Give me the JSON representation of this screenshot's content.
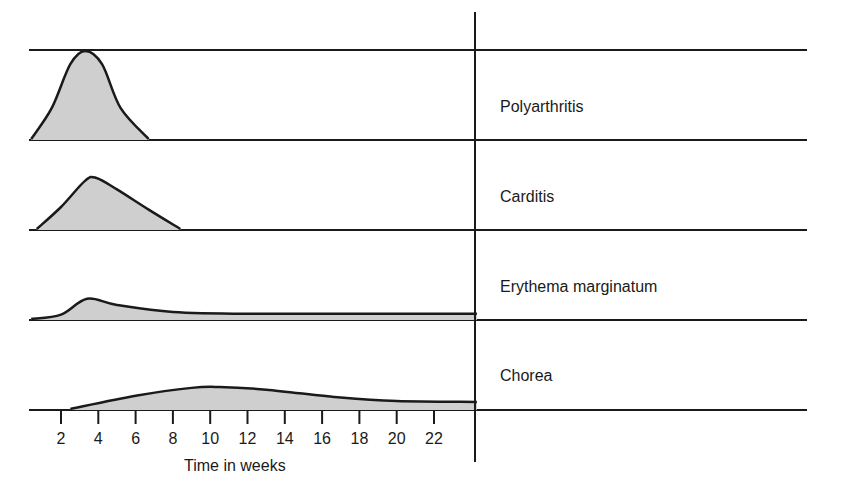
{
  "chart_data": {
    "type": "area",
    "title": "",
    "xlabel": "Time in weeks",
    "ylabel": "",
    "x_ticks": [
      2,
      4,
      6,
      8,
      10,
      12,
      14,
      16,
      18,
      20,
      22
    ],
    "x_tick_labels": [
      "2",
      "4",
      "6",
      "8",
      "10",
      "12",
      "14",
      "16",
      "18",
      "20",
      "22"
    ],
    "xlim": [
      0.3,
      24.3
    ],
    "grid": false,
    "legend": "none",
    "layout": "stacked rows, one filled curve per row, row labels to the right of a vertical divider",
    "series": [
      {
        "name": "Polyarthritis",
        "fill": "#cfcfcf",
        "relative_intensity": 1.0,
        "onset_week": 0.4,
        "peak_week": 3.3,
        "end_week": 6.7,
        "points": [
          [
            0.4,
            0
          ],
          [
            1.5,
            0.35
          ],
          [
            2.5,
            0.85
          ],
          [
            3.3,
            1.0
          ],
          [
            4.2,
            0.85
          ],
          [
            5.2,
            0.35
          ],
          [
            6.7,
            0
          ]
        ]
      },
      {
        "name": "Carditis",
        "fill": "#cfcfcf",
        "relative_intensity": 0.58,
        "onset_week": 0.7,
        "peak_week": 3.9,
        "end_week": 8.4,
        "points": [
          [
            0.7,
            0
          ],
          [
            2.0,
            0.25
          ],
          [
            3.3,
            0.55
          ],
          [
            3.9,
            0.58
          ],
          [
            5.0,
            0.45
          ],
          [
            6.7,
            0.22
          ],
          [
            8.4,
            0
          ]
        ]
      },
      {
        "name": "Erythema marginatum",
        "fill": "#cfcfcf",
        "relative_intensity": 0.23,
        "onset_week": 0.4,
        "peak_week": 3.4,
        "end_week": 24.3,
        "points": [
          [
            0.4,
            0
          ],
          [
            2.0,
            0.05
          ],
          [
            3.4,
            0.23
          ],
          [
            5.0,
            0.16
          ],
          [
            8.0,
            0.08
          ],
          [
            12.0,
            0.06
          ],
          [
            24.3,
            0.06
          ]
        ]
      },
      {
        "name": "Chorea",
        "fill": "#cfcfcf",
        "relative_intensity": 0.25,
        "onset_week": 2.5,
        "peak_week": 10.5,
        "end_week": 24.3,
        "points": [
          [
            2.5,
            0
          ],
          [
            6.0,
            0.15
          ],
          [
            9.0,
            0.24
          ],
          [
            10.5,
            0.25
          ],
          [
            13.0,
            0.22
          ],
          [
            17.0,
            0.13
          ],
          [
            20.0,
            0.09
          ],
          [
            24.3,
            0.08
          ]
        ]
      }
    ]
  },
  "rows": [
    {
      "label": "Polyarthritis"
    },
    {
      "label": "Carditis"
    },
    {
      "label": "Erythema marginatum"
    },
    {
      "label": "Chorea"
    }
  ],
  "axis": {
    "title": "Time in weeks",
    "ticks": [
      "2",
      "4",
      "6",
      "8",
      "10",
      "12",
      "14",
      "16",
      "18",
      "20",
      "22"
    ]
  },
  "colors": {
    "line": "#1a1a1a",
    "fill": "#cfcfcf"
  }
}
